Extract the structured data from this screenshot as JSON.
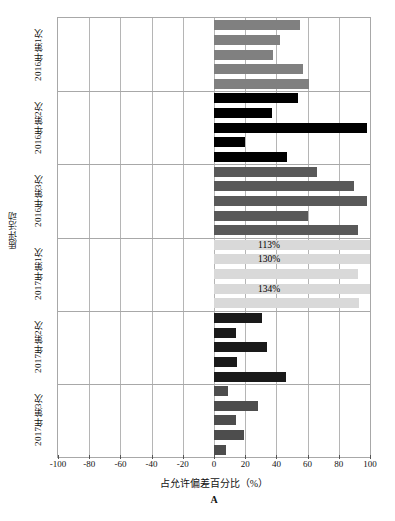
{
  "chart_data": {
    "type": "bar",
    "orientation": "horizontal",
    "title": "",
    "panel_letter": "A",
    "xlabel": "占允许偏差百分比（%）",
    "ylabel": "质评活动",
    "xlim": [
      -100,
      100
    ],
    "xticks": [
      -100,
      -80,
      -60,
      -40,
      -20,
      0,
      20,
      40,
      60,
      80,
      100
    ],
    "xtick_labels": [
      "-100",
      "-80",
      "-60",
      "-40",
      "-20",
      "0",
      "20",
      "40",
      "60",
      "80",
      "100"
    ],
    "grid": "vertical",
    "legend_position": "none",
    "categories": [
      "2016年第1次",
      "2016年第2次",
      "2016年第3次",
      "2017年第1次",
      "2017年第2次",
      "2017年第3次"
    ],
    "groups": [
      {
        "name": "2016年第1次",
        "color": "#808080",
        "values": [
          55,
          42,
          38,
          57,
          61
        ],
        "labels": [
          "",
          "",
          "",
          "",
          ""
        ]
      },
      {
        "name": "2016年第2次",
        "color": "#000000",
        "values": [
          54,
          37,
          98,
          20,
          47
        ],
        "labels": [
          "",
          "",
          "",
          "",
          ""
        ]
      },
      {
        "name": "2016年第3次",
        "color": "#595959",
        "values": [
          66,
          90,
          98,
          60,
          92
        ],
        "labels": [
          "",
          "",
          "",
          "",
          ""
        ]
      },
      {
        "name": "2017年第1次",
        "color": "#d9d9d9",
        "values": [
          113,
          130,
          92,
          134,
          93
        ],
        "labels": [
          "113%",
          "130%",
          "",
          "134%",
          ""
        ]
      },
      {
        "name": "2017年第2次",
        "color": "#1a1a1a",
        "values": [
          31,
          14,
          34,
          15,
          46
        ],
        "labels": [
          "",
          "",
          "",
          "",
          ""
        ]
      },
      {
        "name": "2017年第3次",
        "color": "#4d4d4d",
        "values": [
          9,
          28,
          14,
          19,
          8
        ],
        "labels": [
          "",
          "",
          "",
          "",
          ""
        ]
      }
    ]
  }
}
